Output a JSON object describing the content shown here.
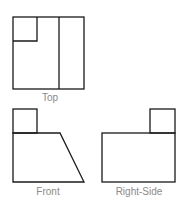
{
  "diagram": {
    "type": "orthographic-projection",
    "line_color": "#1a1a1a",
    "label_color": "#8a8a8a",
    "views": [
      {
        "id": "top",
        "label": "Top"
      },
      {
        "id": "front",
        "label": "Front"
      },
      {
        "id": "right_side",
        "label": "Right-Side"
      }
    ]
  }
}
